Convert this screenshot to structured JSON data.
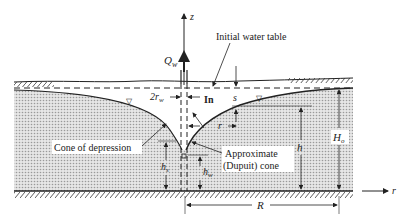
{
  "diagram": {
    "type": "well-drawdown (Dupuit) cross-section",
    "labels": {
      "z_axis": "z",
      "r_axis": "r",
      "discharge": "Q",
      "discharge_sub": "w",
      "initial_water_table": "Initial water table",
      "well_diameter": "2r",
      "well_diameter_sub": "w",
      "inflow": "In",
      "drawdown": "s",
      "radius": "r",
      "cone_of_depression": "Cone of depression",
      "approx_cone_line1": "Approximate",
      "approx_cone_line2": "(Dupuit) cone",
      "head": "h",
      "seepage_head": "h",
      "seepage_head_sub": "s",
      "well_head": "h",
      "well_head_sub": "w",
      "initial_head": "H",
      "initial_head_sub": "o",
      "radius_of_influence": "R"
    },
    "colors": {
      "aquifer_fill": "#d9d9d9",
      "line": "#222222",
      "background": "#ffffff"
    }
  }
}
